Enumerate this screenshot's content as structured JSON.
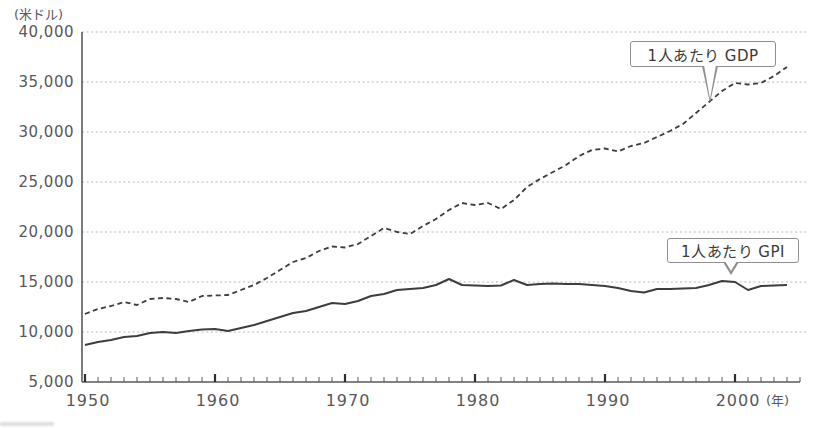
{
  "chart_data": {
    "type": "line",
    "title": "",
    "y_axis": {
      "unit_label": "(米ドル)",
      "min": 5000,
      "max": 40000,
      "tick_interval": 5000,
      "tick_labels": [
        "5,000",
        "10,000",
        "15,000",
        "20,000",
        "25,000",
        "30,000",
        "35,000",
        "40,000"
      ]
    },
    "x_axis": {
      "unit_label": "(年)",
      "min": 1950,
      "max": 2005,
      "minor_tick_interval": 1,
      "major_ticks": [
        1950,
        1960,
        1970,
        1980,
        1990,
        2000
      ]
    },
    "grid": "dotted-horizontal",
    "legend_position": "callouts-on-plot",
    "x": [
      1950,
      1951,
      1952,
      1953,
      1954,
      1955,
      1956,
      1957,
      1958,
      1959,
      1960,
      1961,
      1962,
      1963,
      1964,
      1965,
      1966,
      1967,
      1968,
      1969,
      1970,
      1971,
      1972,
      1973,
      1974,
      1975,
      1976,
      1977,
      1978,
      1979,
      1980,
      1981,
      1982,
      1983,
      1984,
      1985,
      1986,
      1987,
      1988,
      1989,
      1990,
      1991,
      1992,
      1993,
      1994,
      1995,
      1996,
      1997,
      1998,
      1999,
      2000,
      2001,
      2002,
      2003,
      2004
    ],
    "series": [
      {
        "name": "1人あたり GDP",
        "line_style": "dashed",
        "color": "#3d3d3d",
        "values": [
          11800,
          12300,
          12600,
          13000,
          12700,
          13300,
          13400,
          13300,
          13000,
          13600,
          13650,
          13700,
          14200,
          14700,
          15400,
          16200,
          17000,
          17400,
          18100,
          18550,
          18450,
          18800,
          19600,
          20400,
          20000,
          19800,
          20600,
          21300,
          22200,
          22900,
          22700,
          22900,
          22300,
          23200,
          24500,
          25300,
          26000,
          26700,
          27600,
          28200,
          28350,
          28050,
          28600,
          28900,
          29500,
          30100,
          30800,
          31900,
          33000,
          34100,
          34900,
          34750,
          34900,
          35600,
          36500
        ]
      },
      {
        "name": "1人あたり GPI",
        "line_style": "solid",
        "color": "#3d3d3d",
        "values": [
          8700,
          9000,
          9200,
          9500,
          9600,
          9900,
          10000,
          9900,
          10100,
          10250,
          10300,
          10100,
          10400,
          10700,
          11100,
          11500,
          11900,
          12100,
          12500,
          12900,
          12800,
          13100,
          13600,
          13800,
          14200,
          14300,
          14400,
          14700,
          15300,
          14700,
          14650,
          14600,
          14650,
          15200,
          14700,
          14800,
          14850,
          14800,
          14800,
          14700,
          14600,
          14400,
          14100,
          13950,
          14300,
          14300,
          14350,
          14400,
          14700,
          15100,
          15000,
          14200,
          14600,
          14650,
          14700
        ]
      }
    ],
    "colors": {
      "line": "#3d3d3d",
      "gridline": "#b9b9b9",
      "axis": "#5a5a5a",
      "label_text": "#585858",
      "callout_border": "#8f8f8f",
      "background": "#ffffff"
    }
  }
}
